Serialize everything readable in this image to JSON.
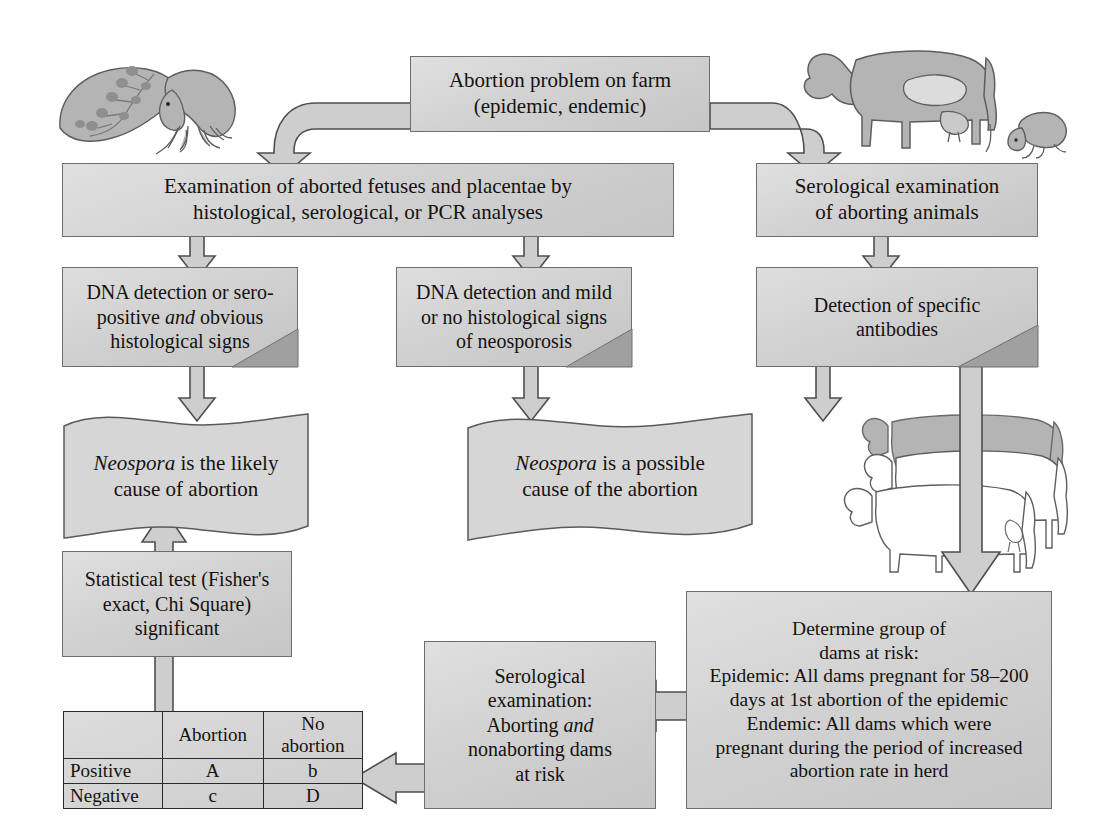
{
  "diagram": {
    "colors": {
      "box_fill_light": "#e0e0e0",
      "box_fill_dark": "#c6c6c6",
      "box_border": "#6e6e6e",
      "fold_shadow": "#9f9f9f",
      "arrow_fill": "#c9c9c9",
      "arrow_stroke": "#555555",
      "illustration_fill": "#b2b2b2",
      "illustration_stroke": "#5c5c5c",
      "table_border": "#2a2a2a",
      "text": "#15120f"
    },
    "nodes": {
      "problem": {
        "line1": "Abortion problem on farm",
        "line2": "(epidemic, endemic)"
      },
      "exam_fetuses": {
        "line1": "Examination of aborted fetuses and placentae by",
        "line2": "histological, serological, or PCR analyses"
      },
      "serology_aborting": {
        "line1": "Serological examination",
        "line2": "of aborting animals"
      },
      "dna_obvious": {
        "line1": "DNA detection or sero-",
        "line2a": "positive ",
        "line2b": "and",
        "line2c": " obvious",
        "line3": "histological signs"
      },
      "dna_mild": {
        "line1": "DNA detection and mild",
        "line2": "or no histological signs",
        "line3": "of neosporosis"
      },
      "antibodies": {
        "line1": "Detection of specific",
        "line2": "antibodies"
      },
      "likely_cause": {
        "line1a": "Neospora",
        "line1b": " is the likely",
        "line2": "cause of abortion"
      },
      "possible_cause": {
        "line1a": "Neospora",
        "line1b": " is a possible",
        "line2": "cause of the abortion"
      },
      "stat_test": {
        "line1": "Statistical test (Fisher's",
        "line2": "exact, Chi Square)",
        "line3": "significant"
      },
      "serology_dams": {
        "line1": "Serological",
        "line2": "examination:",
        "line3a": "Aborting ",
        "line3b": "and",
        "line4": "nonaborting dams",
        "line5": "at risk"
      },
      "determine_group": {
        "line1": "Determine group of",
        "line2": "dams at risk:",
        "line3": "Epidemic: All dams pregnant for 58–200",
        "line4": "days at 1st abortion of the epidemic",
        "line5": "Endemic: All dams which were",
        "line6": "pregnant during the period of increased",
        "line7": "abortion rate in herd"
      }
    },
    "table": {
      "header": [
        "",
        "Abortion",
        "No abortion"
      ],
      "rows": [
        {
          "label": "Positive",
          "abortion": "A",
          "no_abortion": "b"
        },
        {
          "label": "Negative",
          "abortion": "c",
          "no_abortion": "D"
        }
      ]
    },
    "illustrations": [
      {
        "name": "aborted-fetus-with-placenta",
        "position": "top-left"
      },
      {
        "name": "pregnant-cow-with-aborted-fetus",
        "position": "top-right"
      },
      {
        "name": "cow-herd",
        "position": "middle-right"
      }
    ],
    "connectors": [
      {
        "from": "problem",
        "to": "exam_fetuses",
        "shape": "elbow-left-down"
      },
      {
        "from": "problem",
        "to": "serology_aborting",
        "shape": "elbow-right-down"
      },
      {
        "from": "exam_fetuses",
        "to": "dna_obvious",
        "shape": "down"
      },
      {
        "from": "exam_fetuses",
        "to": "dna_mild",
        "shape": "down"
      },
      {
        "from": "serology_aborting",
        "to": "antibodies",
        "shape": "down"
      },
      {
        "from": "dna_obvious",
        "to": "likely_cause",
        "shape": "down"
      },
      {
        "from": "dna_mild",
        "to": "possible_cause",
        "shape": "down"
      },
      {
        "from": "antibodies",
        "to": "possible_cause",
        "shape": "down"
      },
      {
        "from": "antibodies",
        "to": "determine_group",
        "shape": "down-long"
      },
      {
        "from": "stat_test",
        "to": "likely_cause",
        "shape": "up-long"
      },
      {
        "from": "serology_dams",
        "to": "table",
        "shape": "left"
      }
    ]
  }
}
